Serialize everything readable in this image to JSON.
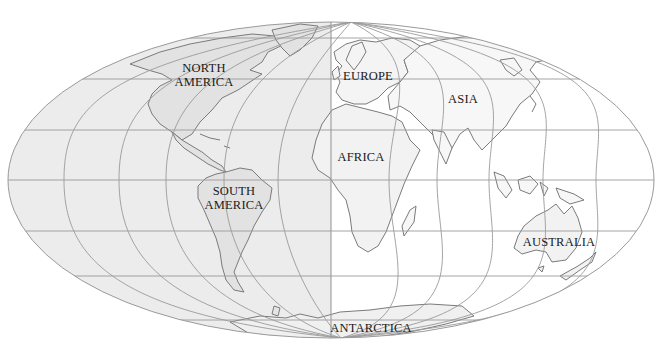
{
  "map": {
    "projection_shape": "ellipse",
    "ellipse": {
      "cx": 331,
      "cy": 180,
      "rx": 323,
      "ry": 158
    },
    "colors": {
      "west_fill": "#ececec",
      "east_fill": "#ffffff",
      "graticule": "#9a9a9a",
      "outline": "#9a9a9a",
      "land_stroke": "#7a7a7a",
      "land_fill_west": "#e4e4e4",
      "land_fill_east": "#f7f7f7",
      "label": "#1a1a1a"
    },
    "parallels_y": [
      38,
      79,
      130,
      180,
      231,
      276,
      320
    ],
    "meridians_equator_x": [
      64,
      119,
      166,
      224,
      278,
      331,
      389,
      437,
      489,
      543,
      596
    ],
    "labels": [
      {
        "id": "north-america",
        "lines": [
          "NORTH",
          "AMERICA"
        ],
        "x": 203,
        "y": 60
      },
      {
        "id": "europe",
        "lines": [
          "EUROPE"
        ],
        "x": 368,
        "y": 69
      },
      {
        "id": "asia",
        "lines": [
          "ASIA"
        ],
        "x": 463,
        "y": 93
      },
      {
        "id": "africa",
        "lines": [
          "AFRICA"
        ],
        "x": 361,
        "y": 150
      },
      {
        "id": "south-america",
        "lines": [
          "SOUTH",
          "AMERICA"
        ],
        "x": 234,
        "y": 184
      },
      {
        "id": "australia",
        "lines": [
          "AUSTRALIA"
        ],
        "x": 558,
        "y": 236
      },
      {
        "id": "antarctica",
        "lines": [
          "ANTARCTICA"
        ],
        "x": 371,
        "y": 321
      }
    ],
    "label_text": {
      "north_america_1": "NORTH",
      "north_america_2": "AMERICA",
      "europe": "EUROPE",
      "asia": "ASIA",
      "africa": "AFRICA",
      "south_america_1": "SOUTH",
      "south_america_2": "AMERICA",
      "australia": "AUSTRALIA",
      "antarctica": "ANTARCTICA"
    }
  }
}
